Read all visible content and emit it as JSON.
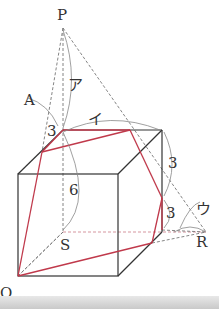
{
  "diagram": {
    "type": "geometry-cube-pyramid",
    "colors": {
      "edge": "#333333",
      "hidden": "#777777",
      "section": "#c0394b",
      "arc": "#888888"
    },
    "points": {
      "P": "P",
      "A": "A",
      "Q": "Q",
      "R": "R",
      "S": "S"
    },
    "angle_labels": {
      "a": "ア",
      "i": "イ",
      "u": "ウ"
    },
    "lengths": {
      "top_segment": "3",
      "vertical": "6",
      "right_upper": "3",
      "right_lower": "3"
    }
  }
}
